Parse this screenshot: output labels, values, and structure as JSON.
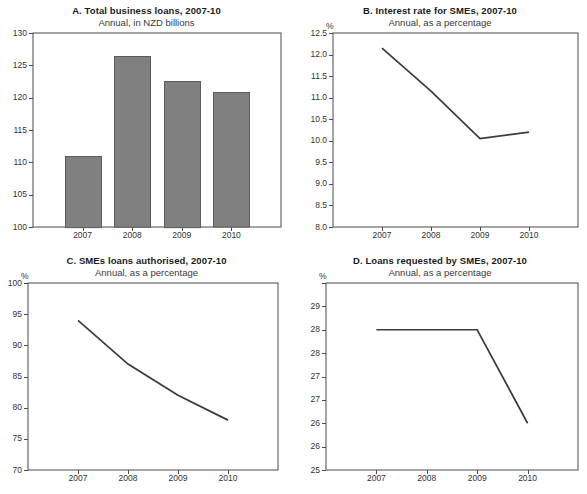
{
  "figure": {
    "background": "#ffffff",
    "axis_color": "#4a4a4a",
    "bar_color": "#808080",
    "line_color": "#3b3b3b",
    "text_color": "#231f20"
  },
  "panels": [
    {
      "id": "A",
      "title": "A. Total business loans, 2007-10",
      "subtitle": "Annual, in NZD billions",
      "unit": ""
    },
    {
      "id": "B",
      "title": "B. Interest rate for SMEs, 2007-10",
      "subtitle": "Annual, as a percentage",
      "unit": "%"
    },
    {
      "id": "C",
      "title": "C. SMEs loans authorised, 2007-10",
      "subtitle": "Annual, as a percentage",
      "unit": "%"
    },
    {
      "id": "D",
      "title": "D. Loans requested by SMEs, 2007-10",
      "subtitle": "Annual, as a percentage",
      "unit": "%"
    }
  ],
  "chart_data": [
    {
      "type": "bar",
      "panel": "A",
      "title": "A. Total business loans, 2007-10",
      "subtitle": "Annual, in NZD billions",
      "xlabel": "",
      "ylabel": "",
      "categories": [
        "2007",
        "2008",
        "2009",
        "2010"
      ],
      "values": [
        111.0,
        126.4,
        122.6,
        120.8
      ],
      "ylim": [
        100,
        130
      ],
      "yticks": [
        100,
        105,
        110,
        115,
        120,
        125,
        130
      ],
      "ytick_labels": [
        "100",
        "105",
        "110",
        "115",
        "120",
        "125",
        "130"
      ],
      "grid": false,
      "legend": "none",
      "series_color": "#808080"
    },
    {
      "type": "line",
      "panel": "B",
      "title": "B. Interest rate for SMEs, 2007-10",
      "subtitle": "Annual, as a percentage",
      "xlabel": "",
      "ylabel": "%",
      "categories": [
        "2007",
        "2008",
        "2009",
        "2010"
      ],
      "values": [
        12.15,
        11.15,
        10.05,
        10.2
      ],
      "ylim": [
        8.0,
        12.5
      ],
      "yticks": [
        8.0,
        8.5,
        9.0,
        9.5,
        10.0,
        10.5,
        11.0,
        11.5,
        12.0,
        12.5
      ],
      "ytick_labels": [
        "8.0",
        "8.5",
        "9.0",
        "9.5",
        "10.0",
        "10.5",
        "11.0",
        "11.5",
        "12.0",
        "12.5"
      ],
      "grid": false,
      "legend": "none",
      "series_color": "#3b3b3b"
    },
    {
      "type": "line",
      "panel": "C",
      "title": "C. SMEs loans authorised, 2007-10",
      "subtitle": "Annual, as a percentage",
      "xlabel": "",
      "ylabel": "%",
      "categories": [
        "2007",
        "2008",
        "2009",
        "2010"
      ],
      "values": [
        94.0,
        87.0,
        82.0,
        78.0
      ],
      "ylim": [
        70,
        100
      ],
      "yticks": [
        70,
        75,
        80,
        85,
        90,
        95,
        100
      ],
      "ytick_labels": [
        "70",
        "75",
        "80",
        "85",
        "90",
        "95",
        "100"
      ],
      "grid": false,
      "legend": "none",
      "series_color": "#3b3b3b"
    },
    {
      "type": "line",
      "panel": "D",
      "title": "D. Loans requested by SMEs, 2007-10",
      "subtitle": "Annual, as a percentage",
      "xlabel": "",
      "ylabel": "%",
      "categories": [
        "2007",
        "2008",
        "2009",
        "2010"
      ],
      "values": [
        28.0,
        28.0,
        28.0,
        26.0
      ],
      "ylim": [
        25,
        29
      ],
      "yticks": [
        25,
        25.5,
        26,
        26.5,
        27,
        27.5,
        28,
        28.5,
        29
      ],
      "ytick_labels": [
        "25",
        "26",
        "26",
        "27",
        "27",
        "28",
        "28",
        "29"
      ],
      "grid": false,
      "legend": "none",
      "series_color": "#3b3b3b"
    }
  ]
}
